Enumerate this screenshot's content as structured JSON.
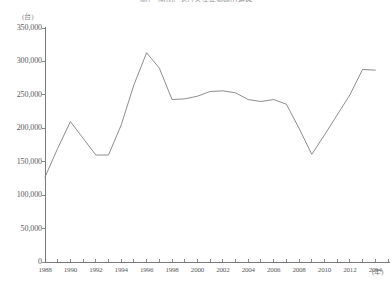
{
  "chart_data": {
    "type": "line",
    "title": "図1　国内における生産台数の推移",
    "xlabel": "(年)",
    "ylabel": "(台)",
    "ylim": [
      0,
      350000
    ],
    "xlim": [
      1988,
      2015
    ],
    "grid": false,
    "legend": "none",
    "ytick_labels": [
      "350,000",
      "300,000",
      "250,000",
      "200,000",
      "150,000",
      "100,000",
      "50,000",
      "0"
    ],
    "ytick_values": [
      350000,
      300000,
      250000,
      200000,
      150000,
      100000,
      50000,
      0
    ],
    "xtick_labels": [
      "1988",
      "1990",
      "1992",
      "1994",
      "1996",
      "1998",
      "2000",
      "2002",
      "2004",
      "2006",
      "2008",
      "2010",
      "2012",
      "2014"
    ],
    "xtick_values": [
      1988,
      1990,
      1992,
      1994,
      1996,
      1998,
      2000,
      2002,
      2004,
      2006,
      2008,
      2010,
      2012,
      2014
    ],
    "x": [
      1988,
      1989,
      1990,
      1991,
      1992,
      1993,
      1994,
      1995,
      1996,
      1997,
      1998,
      1999,
      2000,
      2001,
      2002,
      2003,
      2004,
      2005,
      2006,
      2007,
      2008,
      2009,
      2010,
      2011,
      2012,
      2013,
      2014
    ],
    "values": [
      127000,
      170000,
      210000,
      185000,
      160000,
      160000,
      205000,
      265000,
      313000,
      290000,
      243000,
      244000,
      248000,
      255000,
      256000,
      253000,
      243000,
      240000,
      243000,
      236000,
      200000,
      161000,
      190000,
      220000,
      250000,
      288000,
      287000
    ],
    "series": [
      {
        "name": "生産台数",
        "color": "#808080",
        "values": [
          127000,
          170000,
          210000,
          185000,
          160000,
          160000,
          205000,
          265000,
          313000,
          290000,
          243000,
          244000,
          248000,
          255000,
          256000,
          253000,
          243000,
          240000,
          243000,
          236000,
          200000,
          161000,
          190000,
          220000,
          250000,
          288000,
          287000
        ]
      }
    ],
    "axis_color": "#6b6b6b",
    "line_color": "#808080",
    "plot_area": {
      "left": 45,
      "right": 388,
      "top": 28,
      "bottom": 262
    }
  }
}
